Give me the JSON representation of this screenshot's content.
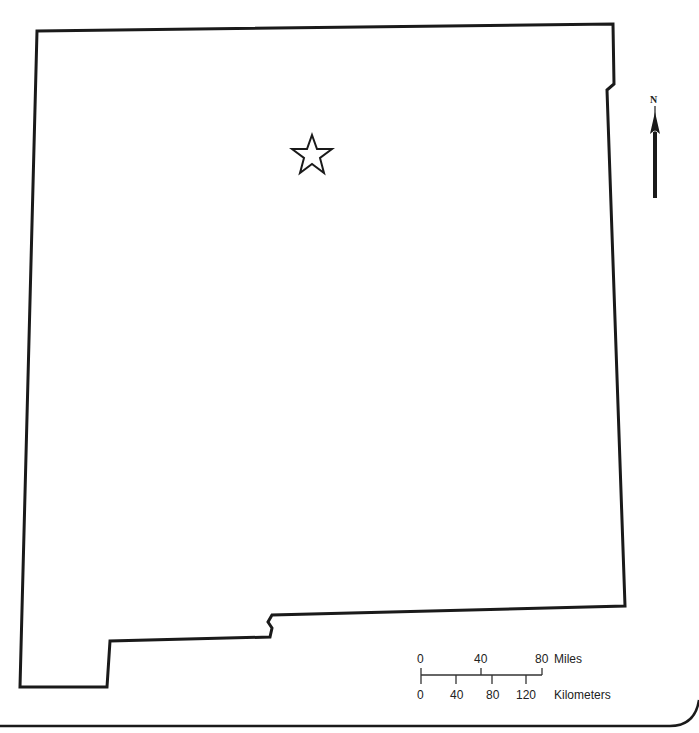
{
  "map": {
    "region": "New Mexico state outline",
    "outline_color": "#1a1a1a",
    "capital_marker": "star-icon"
  },
  "north_arrow": {
    "label": "N"
  },
  "scale_bar": {
    "miles_label": "Miles",
    "miles_ticks": [
      "0",
      "40",
      "80"
    ],
    "km_label": "Kilometers",
    "km_ticks": [
      "0",
      "40",
      "80",
      "120"
    ]
  }
}
